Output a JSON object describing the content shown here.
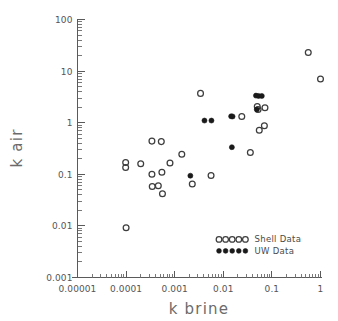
{
  "chart_data": {
    "type": "scatter",
    "title": "",
    "xlabel": "k  brine",
    "ylabel": "k  air",
    "xscale": "log",
    "yscale": "log",
    "xlim": [
      1e-05,
      1
    ],
    "ylim": [
      0.001,
      100
    ],
    "grid": false,
    "xticks": [
      "0.00001",
      "0.0001",
      "0.001",
      "0.01",
      "0.1",
      "1"
    ],
    "xtick_values": [
      1e-05,
      0.0001,
      0.001,
      0.01,
      0.1,
      1
    ],
    "yticks": [
      "0.001",
      "0.01",
      "0.1",
      "1",
      "10",
      "100"
    ],
    "ytick_values": [
      0.001,
      0.01,
      0.1,
      1,
      10,
      100
    ],
    "legend_position": "lower right",
    "series": [
      {
        "name": "Shell  Data",
        "marker": "open-circle",
        "color": "#3d3d3d",
        "points": [
          [
            0.0001,
            0.0092
          ],
          [
            9.8e-05,
            0.17
          ],
          [
            9.8e-05,
            0.135
          ],
          [
            0.0002,
            0.16
          ],
          [
            0.00034,
            0.44
          ],
          [
            0.00034,
            0.1
          ],
          [
            0.000345,
            0.058
          ],
          [
            0.00046,
            0.06
          ],
          [
            0.00053,
            0.43
          ],
          [
            0.000545,
            0.11
          ],
          [
            0.00056,
            0.042
          ],
          [
            0.0008,
            0.165
          ],
          [
            0.0014,
            0.245
          ],
          [
            0.0023,
            0.065
          ],
          [
            0.0034,
            3.7
          ],
          [
            0.0056,
            0.095
          ],
          [
            0.024,
            1.32
          ],
          [
            0.036,
            0.265
          ],
          [
            0.05,
            2.05
          ],
          [
            0.052,
            1.8
          ],
          [
            0.055,
            0.715
          ],
          [
            0.07,
            0.87
          ],
          [
            0.072,
            1.95
          ],
          [
            0.56,
            23.0
          ],
          [
            1.0,
            7.0
          ]
        ]
      },
      {
        "name": "UW  Data",
        "marker": "filled-circle",
        "color": "#1a1a1a",
        "points": [
          [
            0.0021,
            0.094
          ],
          [
            0.0041,
            1.1
          ],
          [
            0.0057,
            1.1
          ],
          [
            0.0145,
            1.33
          ],
          [
            0.0155,
            1.32
          ],
          [
            0.015,
            0.335
          ],
          [
            0.047,
            3.35
          ],
          [
            0.053,
            3.3
          ],
          [
            0.049,
            1.8
          ],
          [
            0.062,
            3.3
          ]
        ]
      }
    ]
  },
  "axes": {
    "x_title": "k  brine",
    "y_title": "k  air",
    "x_tick_labels": [
      "0.00001",
      "0.0001",
      "0.001",
      "0.01",
      "0.1",
      "1"
    ],
    "y_tick_labels": [
      "0.001",
      "0.01",
      "0.1",
      "1",
      "10",
      "100"
    ]
  },
  "legend": {
    "items": [
      {
        "label": "Shell  Data",
        "marker": "open-circle"
      },
      {
        "label": "UW  Data",
        "marker": "filled-circle"
      }
    ]
  }
}
